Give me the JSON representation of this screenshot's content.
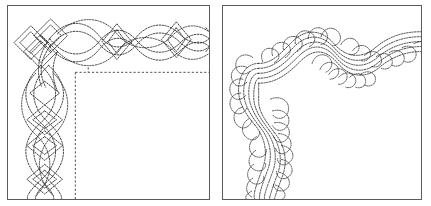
{
  "figure": {
    "background_color": "#ffffff",
    "stitch_color": "#2b2b2b",
    "frame_color": "#5b5b5b",
    "panel_count": 2
  },
  "panels": [
    {
      "id": "panel-left",
      "name": "celtic-knot-border-corner",
      "label": "Celtic interlace knotwork border corner",
      "motif": "interlaced-braid-with-diamonds",
      "line_style": "dashed-stitch",
      "has_inner_guide_rectangle": true,
      "inner_guide_style": "dashed",
      "tick_mark": true,
      "bounds": {
        "x": 7,
        "y": 5,
        "width": 203,
        "height": 195
      }
    },
    {
      "id": "panel-right",
      "name": "feather-plume-border-corner",
      "label": "Feathered plume border corner",
      "motif": "undulating-feather-with-spine-lines",
      "line_style": "dashed-stitch",
      "spine_line_count": 5,
      "has_inner_guide_rectangle": false,
      "bounds": {
        "x": 222,
        "y": 5,
        "width": 200,
        "height": 195
      }
    }
  ]
}
